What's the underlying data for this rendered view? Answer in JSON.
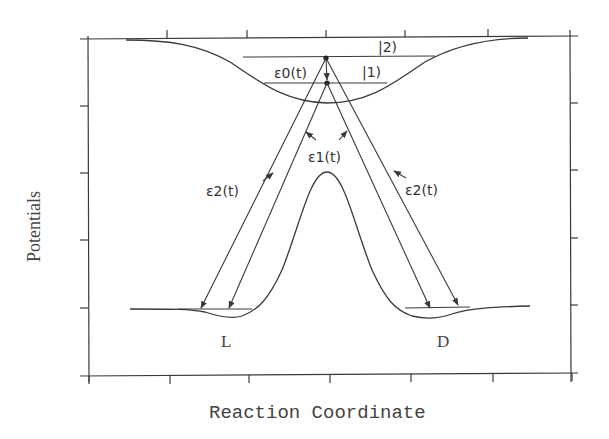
{
  "diagram": {
    "y_axis_label": "Potentials",
    "x_axis_label": "Reaction Coordinate",
    "states": {
      "upper": "|2)",
      "middle": "|1)",
      "left_well": "L",
      "right_well": "D"
    },
    "pulses": {
      "pump": "ε0(t)",
      "dump_inner": "ε1(t)",
      "dump_outer_left": "ε2(t)",
      "dump_outer_right": "ε2(t)"
    },
    "colors": {
      "line": "#3a3a3a",
      "background": "#ffffff"
    },
    "x_ticks": [
      89,
      170,
      249,
      330,
      411,
      493,
      572
    ],
    "y_ticks": [
      39,
      106,
      173,
      240,
      308,
      376
    ]
  }
}
